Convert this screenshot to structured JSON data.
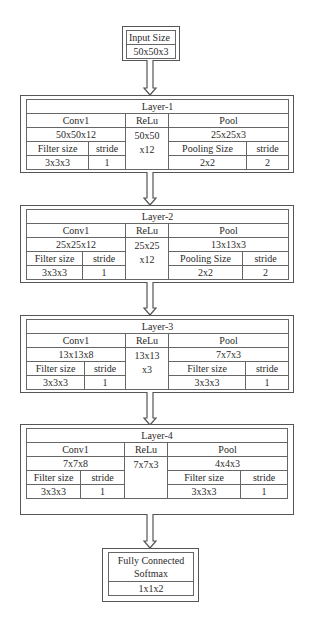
{
  "input": {
    "label": "Input Size",
    "value": "50x50x3"
  },
  "layers": [
    {
      "title": "Layer-1",
      "conv": {
        "label": "Conv1",
        "output": "50x50x12",
        "filter_label": "Filter size",
        "filter": "3x3x3",
        "stride_label": "stride",
        "stride": "1"
      },
      "relu": {
        "label": "ReLu",
        "output_line1": "50x50",
        "output_line2": "x12"
      },
      "pool": {
        "label": "Pool",
        "output": "25x25x3",
        "size_label": "Pooling Size",
        "size": "2x2",
        "stride_label": "stride",
        "stride": "2"
      }
    },
    {
      "title": "Layer-2",
      "conv": {
        "label": "Conv1",
        "output": "25x25x12",
        "filter_label": "Filter size",
        "filter": "3x3x3",
        "stride_label": "stride",
        "stride": "1"
      },
      "relu": {
        "label": "ReLu",
        "output_line1": "25x25",
        "output_line2": "x12"
      },
      "pool": {
        "label": "Pool",
        "output": "13x13x3",
        "size_label": "Pooling Size",
        "size": "2x2",
        "stride_label": "stride",
        "stride": "2"
      }
    },
    {
      "title": "Layer-3",
      "conv": {
        "label": "Conv1",
        "output": "13x13x8",
        "filter_label": "Filter size",
        "filter": "3x3x3",
        "stride_label": "stride",
        "stride": "1"
      },
      "relu": {
        "label": "ReLu",
        "output_line1": "13x13",
        "output_line2": "x3"
      },
      "pool": {
        "label": "Pool",
        "output": "7x7x3",
        "size_label": "Filter size",
        "size": "3x3x3",
        "stride_label": "stride",
        "stride": "1"
      }
    },
    {
      "title": "Layer-4",
      "conv": {
        "label": "Conv1",
        "output": "7x7x8",
        "filter_label": "Filter size",
        "filter": "3x3x3",
        "stride_label": "stride",
        "stride": "1"
      },
      "relu": {
        "label": "ReLu",
        "output_line1": "7x7x3",
        "output_line2": ""
      },
      "pool": {
        "label": "Pool",
        "output": "4x4x3",
        "size_label": "Filter size",
        "size": "3x3x3",
        "stride_label": "stride",
        "stride": "1"
      }
    }
  ],
  "output": {
    "label_line1": "Fully Connected",
    "label_line2": "Softmax",
    "value": "1x1x2"
  }
}
